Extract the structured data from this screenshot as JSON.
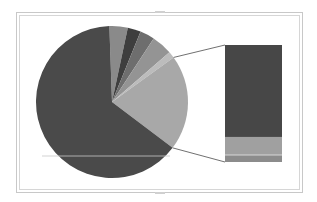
{
  "chart_data": {
    "type": "pie",
    "subtype": "bar-of-pie",
    "title": "",
    "legend": "none",
    "data_labels": "none",
    "primary_pie": {
      "center": [
        112,
        102
      ],
      "radius": 76,
      "start_angle_deg": -2,
      "slices": [
        {
          "name": "Slice A",
          "value": 3.9,
          "color": "#8a8a8a"
        },
        {
          "name": "Slice B",
          "value": 2.8,
          "color": "#3e3e3e"
        },
        {
          "name": "Slice C",
          "value": 3.1,
          "color": "#6e6e6e"
        },
        {
          "name": "Slice D",
          "value": 4.4,
          "color": "#949494"
        },
        {
          "name": "Slice E",
          "value": 1.4,
          "color": "#bcbcbc"
        },
        {
          "name": "Other",
          "value": 20.3,
          "color": "#a8a8a8",
          "expanded": true
        },
        {
          "name": "Slice G",
          "value": 64.2,
          "color": "#4a4a4a"
        }
      ]
    },
    "secondary_bar": {
      "x": 225,
      "y": 45,
      "width": 57,
      "height": 117,
      "segments": [
        {
          "name": "Other part 1",
          "value": 78.6,
          "color": "#474747"
        },
        {
          "name": "Other part 2",
          "value": 15.4,
          "color": "#a0a0a0"
        },
        {
          "name": "Other part 3",
          "value": 6.0,
          "color": "#8c8c8c"
        }
      ]
    },
    "connector_color": "#606060"
  }
}
